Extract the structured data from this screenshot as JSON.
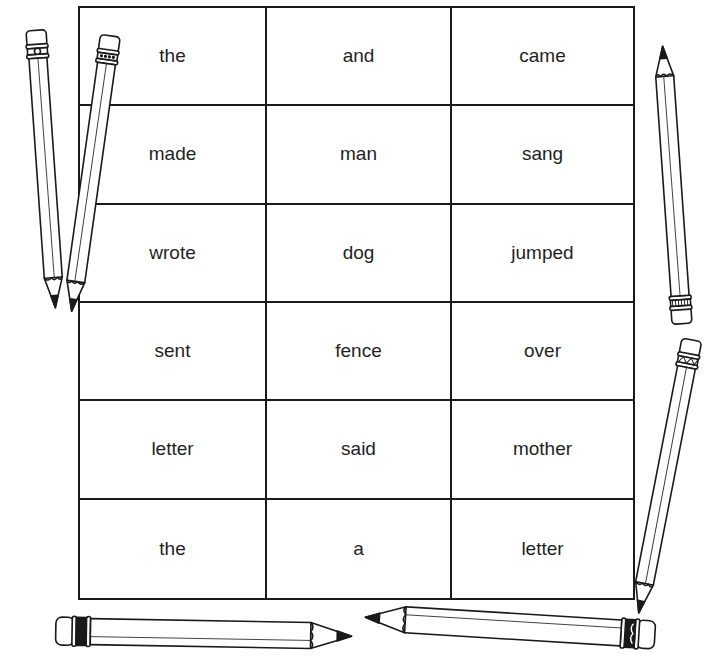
{
  "worksheet": {
    "grid": {
      "columns": 3,
      "rows": [
        [
          "the",
          "and",
          "came"
        ],
        [
          "made",
          "man",
          "sang"
        ],
        [
          "wrote",
          "dog",
          "jumped"
        ],
        [
          "sent",
          "fence",
          "over"
        ],
        [
          "letter",
          "said",
          "mother"
        ],
        [
          "the",
          "a",
          "letter"
        ]
      ]
    },
    "decorations": [
      {
        "icon": "pencil-icon",
        "position": "left-top",
        "orientation": "tip-down"
      },
      {
        "icon": "pencil-icon",
        "position": "left-bottom",
        "orientation": "tip-up"
      },
      {
        "icon": "pencil-icon",
        "position": "right-top",
        "orientation": "tip-up"
      },
      {
        "icon": "pencil-icon",
        "position": "right-bottom",
        "orientation": "tip-down"
      },
      {
        "icon": "pencil-icon",
        "position": "bottom-left",
        "orientation": "tip-right"
      },
      {
        "icon": "pencil-icon",
        "position": "bottom-right",
        "orientation": "tip-left"
      }
    ],
    "colors": {
      "ink": "#1a1a1a",
      "paper": "#ffffff"
    }
  }
}
